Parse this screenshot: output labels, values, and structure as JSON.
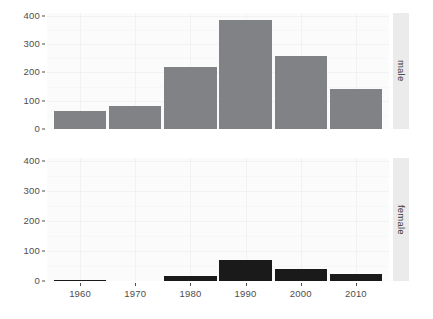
{
  "chart_data": {
    "type": "bar",
    "title": "",
    "xlabel": "",
    "ylabel": "",
    "categories": [
      1960,
      1970,
      1980,
      1990,
      2000,
      2010
    ],
    "x_tick_labels": [
      "1960",
      "1970",
      "1980",
      "1990",
      "2000",
      "2010"
    ],
    "y_tick_labels": [
      "0",
      "100",
      "200",
      "300",
      "400"
    ],
    "y_ticks": [
      0,
      100,
      200,
      300,
      400
    ],
    "ylim": [
      0,
      410
    ],
    "xlim": [
      1954,
      2016
    ],
    "grid": true,
    "legend": "none",
    "facet_position": "right",
    "bar_width_years": 9.5,
    "panels": [
      {
        "facet_label": "male",
        "bar_color": "#808285",
        "values": [
          63,
          80,
          220,
          387,
          258,
          142
        ]
      },
      {
        "facet_label": "female",
        "bar_color": "#1a1a1a",
        "values": [
          2,
          0,
          16,
          70,
          41,
          22
        ]
      }
    ]
  },
  "axis": {
    "y_labels_male": [
      "400",
      "300",
      "200",
      "100",
      "0"
    ],
    "y_labels_female": [
      "400",
      "300",
      "200",
      "100",
      "0"
    ],
    "x_labels": [
      "1960",
      "1970",
      "1980",
      "1990",
      "2000",
      "2010"
    ]
  },
  "strips": {
    "top": "male",
    "bottom": "female"
  }
}
